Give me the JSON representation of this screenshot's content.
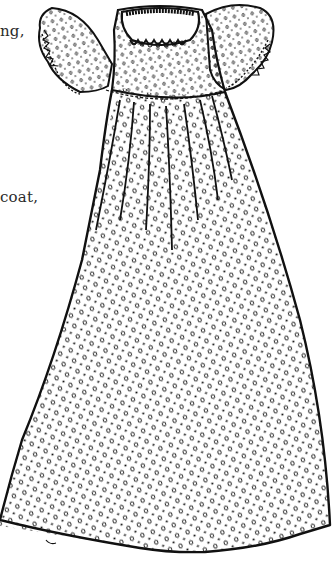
{
  "page": {
    "text_fragments": [
      {
        "text": "ng,"
      },
      {
        "text": "coat,"
      }
    ]
  },
  "illustration": {
    "subject": "christening-gown",
    "style": "black ink line drawing",
    "pattern": "polka-dot",
    "features": [
      "puffed sleeves",
      "scalloped collar",
      "dotted yoke seam",
      "pleated skirt",
      "flared hem"
    ],
    "ink_color": "#111111",
    "background_color": "#ffffff"
  }
}
